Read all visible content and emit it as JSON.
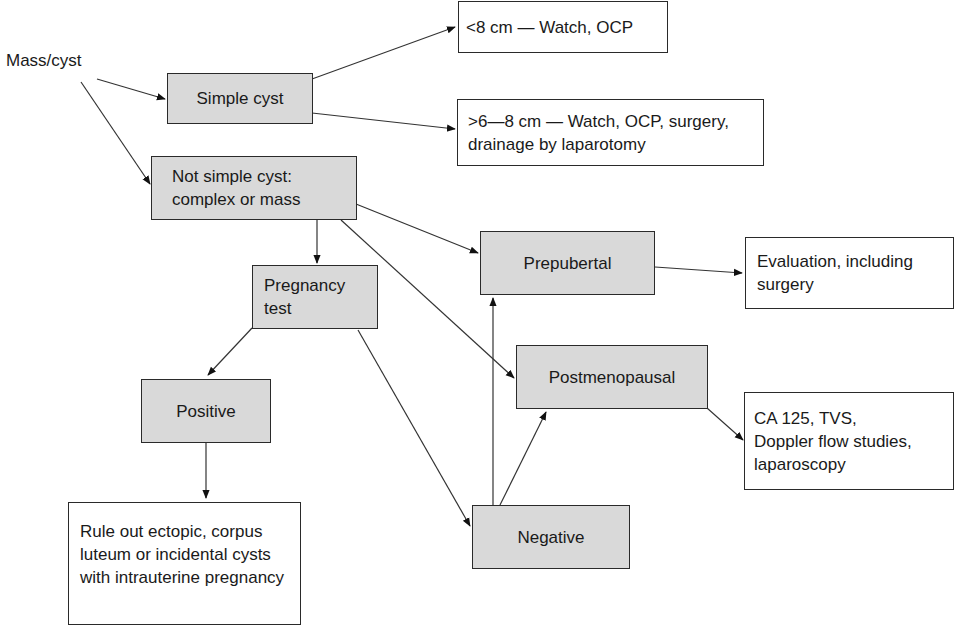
{
  "diagram": {
    "start_label": "Mass/cyst",
    "nodes": {
      "simple_cyst": {
        "lines": [
          "Simple cyst"
        ]
      },
      "not_simple": {
        "lines": [
          "Not simple cyst:",
          "complex or mass"
        ]
      },
      "lt8": {
        "lines": [
          "<8 cm — Watch, OCP"
        ]
      },
      "gt6_8": {
        "lines": [
          ">6—8 cm — Watch, OCP, surgery,",
          "drainage by laparotomy"
        ]
      },
      "pregnancy_test": {
        "lines": [
          "Pregnancy",
          "test"
        ]
      },
      "prepubertal": {
        "lines": [
          "Prepubertal"
        ]
      },
      "evaluation": {
        "lines": [
          "Evaluation, including",
          "surgery"
        ]
      },
      "postmenopausal": {
        "lines": [
          "Postmenopausal"
        ]
      },
      "ca125": {
        "lines": [
          "CA 125, TVS,",
          "Doppler flow studies,",
          "laparoscopy"
        ]
      },
      "positive": {
        "lines": [
          "Positive"
        ]
      },
      "negative": {
        "lines": [
          "Negative"
        ]
      },
      "rule_out": {
        "lines": [
          "Rule out ectopic, corpus",
          "luteum or incidental cysts",
          "with intrauterine pregnancy"
        ]
      }
    },
    "edges": [
      {
        "from": "Mass/cyst",
        "to": "Simple cyst"
      },
      {
        "from": "Mass/cyst",
        "to": "Not simple cyst"
      },
      {
        "from": "Simple cyst",
        "to": "<8 cm"
      },
      {
        "from": "Simple cyst",
        "to": ">6-8 cm"
      },
      {
        "from": "Not simple cyst",
        "to": "Pregnancy test"
      },
      {
        "from": "Not simple cyst",
        "to": "Prepubertal"
      },
      {
        "from": "Not simple cyst",
        "to": "Postmenopausal"
      },
      {
        "from": "Prepubertal",
        "to": "Evaluation"
      },
      {
        "from": "Postmenopausal",
        "to": "CA 125"
      },
      {
        "from": "Pregnancy test",
        "to": "Positive"
      },
      {
        "from": "Pregnancy test",
        "to": "Negative"
      },
      {
        "from": "Positive",
        "to": "Rule out"
      },
      {
        "from": "Negative",
        "to": "Prepubertal"
      },
      {
        "from": "Negative",
        "to": "Postmenopausal"
      }
    ],
    "colors": {
      "shaded_fill": "#d9d9d9",
      "line": "#2a2a2a",
      "background": "#ffffff"
    }
  }
}
